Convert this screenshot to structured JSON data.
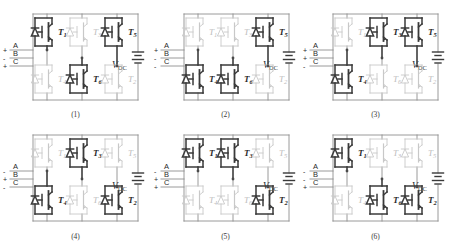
{
  "figure": {
    "device_type": "IGBT with anti-parallel diode",
    "phase_labels": [
      "A",
      "B",
      "C"
    ],
    "source_label": "V",
    "source_subscript": "DC",
    "colors": {
      "active": "#3a3a3a",
      "inactive": "#c8c8c8",
      "wire": "#8e8e8e",
      "wire_active": "#4a4a4a",
      "text_active": "#2b2b2b",
      "text_inactive": "#bdbdbd",
      "background": "#ffffff"
    },
    "transistor_names": [
      "T1",
      "T2",
      "T3",
      "T4",
      "T5",
      "T6"
    ],
    "top_row_devices": [
      "T1",
      "T3",
      "T5"
    ],
    "bottom_row_devices": [
      "T4",
      "T6",
      "T2"
    ]
  },
  "circuits": [
    {
      "caption": "(1)",
      "polarities": [
        "+",
        "-",
        "+"
      ],
      "top": [
        {
          "label": "T",
          "sub": "1",
          "on": true
        },
        {
          "label": "T",
          "sub": "3",
          "on": false
        },
        {
          "label": "T",
          "sub": "5",
          "on": true
        }
      ],
      "bottom": [
        {
          "label": "T",
          "sub": "4",
          "on": false
        },
        {
          "label": "T",
          "sub": "6",
          "on": true
        },
        {
          "label": "T",
          "sub": "2",
          "on": false
        }
      ]
    },
    {
      "caption": "(2)",
      "polarities": [
        "+",
        "-",
        "-"
      ],
      "top": [
        {
          "label": "T",
          "sub": "1",
          "on": false
        },
        {
          "label": "T",
          "sub": "3",
          "on": false
        },
        {
          "label": "T",
          "sub": "5",
          "on": true
        }
      ],
      "bottom": [
        {
          "label": "T",
          "sub": "4",
          "on": true
        },
        {
          "label": "T",
          "sub": "6",
          "on": true
        },
        {
          "label": "T",
          "sub": "2",
          "on": false
        }
      ]
    },
    {
      "caption": "(3)",
      "polarities": [
        "+",
        "+",
        "-"
      ],
      "top": [
        {
          "label": "T",
          "sub": "1",
          "on": false
        },
        {
          "label": "T",
          "sub": "3",
          "on": true
        },
        {
          "label": "T",
          "sub": "5",
          "on": true
        }
      ],
      "bottom": [
        {
          "label": "T",
          "sub": "4",
          "on": true
        },
        {
          "label": "T",
          "sub": "6",
          "on": false
        },
        {
          "label": "T",
          "sub": "2",
          "on": false
        }
      ]
    },
    {
      "caption": "(4)",
      "polarities": [
        "-",
        "+",
        "-"
      ],
      "top": [
        {
          "label": "T",
          "sub": "1",
          "on": false
        },
        {
          "label": "T",
          "sub": "3",
          "on": true
        },
        {
          "label": "T",
          "sub": "5",
          "on": false
        }
      ],
      "bottom": [
        {
          "label": "T",
          "sub": "4",
          "on": true
        },
        {
          "label": "T",
          "sub": "6",
          "on": false
        },
        {
          "label": "T",
          "sub": "2",
          "on": true
        }
      ]
    },
    {
      "caption": "(5)",
      "polarities": [
        "-",
        "+",
        "+"
      ],
      "top": [
        {
          "label": "T",
          "sub": "1",
          "on": true
        },
        {
          "label": "T",
          "sub": "3",
          "on": true
        },
        {
          "label": "T",
          "sub": "5",
          "on": false
        }
      ],
      "bottom": [
        {
          "label": "T",
          "sub": "4",
          "on": false
        },
        {
          "label": "T",
          "sub": "6",
          "on": false
        },
        {
          "label": "T",
          "sub": "2",
          "on": true
        }
      ]
    },
    {
      "caption": "(6)",
      "polarities": [
        "-",
        "-",
        "+"
      ],
      "top": [
        {
          "label": "T",
          "sub": "1",
          "on": true
        },
        {
          "label": "T",
          "sub": "3",
          "on": false
        },
        {
          "label": "T",
          "sub": "5",
          "on": false
        }
      ],
      "bottom": [
        {
          "label": "T",
          "sub": "4",
          "on": false
        },
        {
          "label": "T",
          "sub": "6",
          "on": true
        },
        {
          "label": "T",
          "sub": "2",
          "on": true
        }
      ]
    }
  ]
}
